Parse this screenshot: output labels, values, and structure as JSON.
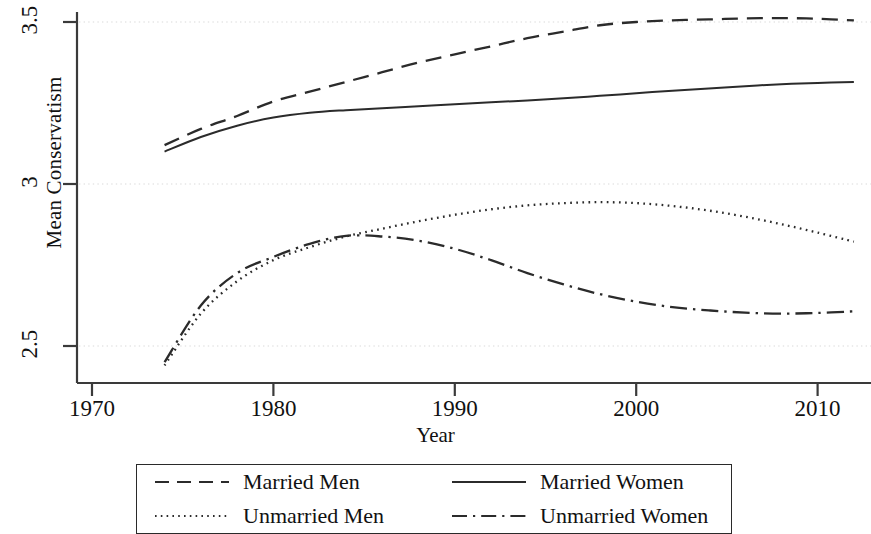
{
  "chart_data": {
    "type": "line",
    "title": "",
    "xlabel": "Year",
    "ylabel": "Mean Conservatism",
    "xlim": [
      1968.5,
      2014.5
    ],
    "ylim": [
      2.42,
      3.54
    ],
    "xticks": [
      1970,
      1980,
      1990,
      2000,
      2010
    ],
    "yticks": [
      2.5,
      3,
      3.5
    ],
    "xtick_labels": [
      "1970",
      "1980",
      "1990",
      "2000",
      "2010"
    ],
    "ytick_labels": [
      "2.5",
      "3",
      "3.5"
    ],
    "grid": "horizontal-dotted",
    "legend_position": "below-plot",
    "series": [
      {
        "name": "Married Men",
        "style": "dashed",
        "color": "#2b2b2b",
        "x": [
          1974,
          1976,
          1978,
          1980,
          1982,
          1984,
          1986,
          1988,
          1990,
          1992,
          1994,
          1996,
          1998,
          2000,
          2002,
          2004,
          2006,
          2008,
          2010,
          2012
        ],
        "values": [
          3.12,
          3.17,
          3.21,
          3.255,
          3.285,
          3.315,
          3.345,
          3.375,
          3.4,
          3.425,
          3.45,
          3.47,
          3.49,
          3.5,
          3.505,
          3.508,
          3.511,
          3.512,
          3.51,
          3.505
        ]
      },
      {
        "name": "Married Women",
        "style": "solid",
        "color": "#2b2b2b",
        "x": [
          1974,
          1976,
          1978,
          1980,
          1982,
          1984,
          1986,
          1988,
          1990,
          1992,
          1994,
          1996,
          1998,
          2000,
          2002,
          2004,
          2006,
          2008,
          2010,
          2012
        ],
        "values": [
          3.1,
          3.145,
          3.18,
          3.205,
          3.22,
          3.228,
          3.234,
          3.24,
          3.246,
          3.252,
          3.258,
          3.265,
          3.272,
          3.28,
          3.288,
          3.295,
          3.302,
          3.308,
          3.312,
          3.315
        ]
      },
      {
        "name": "Unmarried Men",
        "style": "dotted",
        "color": "#2b2b2b",
        "x": [
          1974,
          1976,
          1978,
          1980,
          1982,
          1984,
          1986,
          1988,
          1990,
          1992,
          1994,
          1996,
          1998,
          2000,
          2002,
          2004,
          2006,
          2008,
          2010,
          2012
        ],
        "values": [
          2.44,
          2.6,
          2.7,
          2.765,
          2.805,
          2.838,
          2.862,
          2.885,
          2.905,
          2.922,
          2.934,
          2.941,
          2.944,
          2.941,
          2.932,
          2.918,
          2.899,
          2.876,
          2.85,
          2.822
        ]
      },
      {
        "name": "Unmarried Women",
        "style": "dash-dot",
        "color": "#2b2b2b",
        "x": [
          1974,
          1976,
          1978,
          1980,
          1982,
          1984,
          1986,
          1988,
          1990,
          1992,
          1994,
          1996,
          1998,
          2000,
          2002,
          2004,
          2006,
          2008,
          2010,
          2012
        ],
        "values": [
          2.45,
          2.625,
          2.725,
          2.775,
          2.815,
          2.84,
          2.838,
          2.825,
          2.8,
          2.765,
          2.725,
          2.69,
          2.66,
          2.637,
          2.62,
          2.61,
          2.603,
          2.6,
          2.602,
          2.607
        ]
      }
    ]
  },
  "axes": {
    "ylabel": "Mean Conservatism",
    "xlabel": "Year",
    "yticks": [
      "3.5",
      "3",
      "2.5"
    ],
    "xticks": [
      "1970",
      "1980",
      "1990",
      "2000",
      "2010"
    ]
  },
  "legend": {
    "entries": [
      {
        "label": "Married Men",
        "style": "dashed"
      },
      {
        "label": "Married Women",
        "style": "solid"
      },
      {
        "label": "Unmarried Men",
        "style": "dotted"
      },
      {
        "label": "Unmarried Women",
        "style": "dash-dot"
      }
    ]
  },
  "colors": {
    "line": "#2b2b2b",
    "axis": "#3a3a3a",
    "grid": "#d9d9d9",
    "background": "#ffffff"
  }
}
